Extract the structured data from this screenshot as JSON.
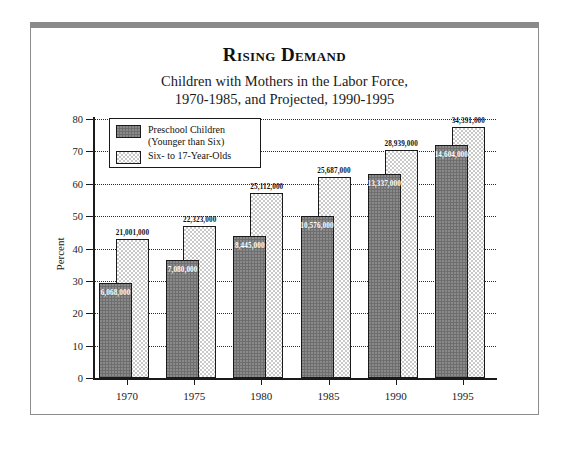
{
  "title": "Rising Demand",
  "subtitle_line1": "Children with Mothers in the Labor Force,",
  "subtitle_line2": "1970-1985, and Projected, 1990-1995",
  "legend": {
    "preschool_line1": "Preschool Children",
    "preschool_line2": "(Younger than Six)",
    "schoolage": "Six- to 17-Year-Olds"
  },
  "colors": {
    "preschool_fill": "#6e6e6e",
    "schoolage_fill": "#c9c9c9",
    "axis": "#1a1a1a",
    "frame": "#8a8a8a"
  },
  "chart_data": {
    "type": "bar",
    "title": "Rising Demand",
    "subtitle": "Children with Mothers in the Labor Force, 1970-1985, and Projected, 1990-1995",
    "xlabel": "",
    "ylabel": "Percent",
    "ylim": [
      0,
      80
    ],
    "yticks": [
      0,
      10,
      20,
      30,
      40,
      50,
      60,
      70,
      80
    ],
    "ytick_labels": [
      "0",
      "10",
      "20",
      "30",
      "40",
      "50",
      "60",
      "70",
      "80"
    ],
    "grid": true,
    "grid_style": "dotted-horizontal",
    "legend_position": "upper-left-inside",
    "categories": [
      "1970",
      "1975",
      "1980",
      "1985",
      "1990",
      "1995"
    ],
    "series": [
      {
        "name": "Preschool Children (Younger than Six)",
        "fill": "#6e6e6e",
        "values": [
          29.5,
          36.5,
          44.0,
          50.0,
          63.0,
          72.0
        ],
        "data_labels": [
          "6,068,000",
          "7,080,000",
          "8,445,000",
          "10,576,000",
          "13,337,000",
          "14,604,000"
        ]
      },
      {
        "name": "Six- to 17-Year-Olds",
        "fill": "#c9c9c9",
        "values": [
          43.0,
          47.0,
          57.0,
          62.0,
          70.5,
          77.5
        ],
        "data_labels": [
          "21,001,000",
          "22,323,000",
          "25,112,000",
          "25,687,000",
          "28,939,000",
          "34,391,000"
        ]
      }
    ]
  }
}
